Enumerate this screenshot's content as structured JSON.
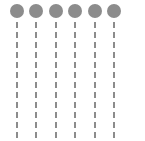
{
  "figure": {
    "title": "",
    "background_color": "#ffffff",
    "width": 145,
    "height": 141
  },
  "chart_data": {
    "type": "diagram",
    "title": "",
    "subtitle": "",
    "xlabel": "",
    "ylabel": "",
    "grid": false,
    "legend": "none",
    "marker_shape": "circle",
    "marker_color": "#8c8c8c",
    "marker_diameter": 14,
    "line_style": "dashed",
    "line_color": "#8c8c8c",
    "line_width": 2,
    "dash_length": 6,
    "dash_gap": 4,
    "column_count": 6,
    "row_count": 1,
    "circle_center_y": 11,
    "line_top_y": 22,
    "line_bottom_y": 139,
    "columns": [
      {
        "index": 1,
        "label": "",
        "center_x": 17,
        "circle_cy": 11,
        "line_x": 17
      },
      {
        "index": 2,
        "label": "",
        "center_x": 36,
        "circle_cy": 11,
        "line_x": 36
      },
      {
        "index": 3,
        "label": "",
        "center_x": 56,
        "circle_cy": 11,
        "line_x": 56
      },
      {
        "index": 4,
        "label": "",
        "center_x": 75,
        "circle_cy": 11,
        "line_x": 75
      },
      {
        "index": 5,
        "label": "",
        "center_x": 95,
        "circle_cy": 11,
        "line_x": 95
      },
      {
        "index": 6,
        "label": "",
        "center_x": 114,
        "circle_cy": 11,
        "line_x": 114
      }
    ]
  }
}
